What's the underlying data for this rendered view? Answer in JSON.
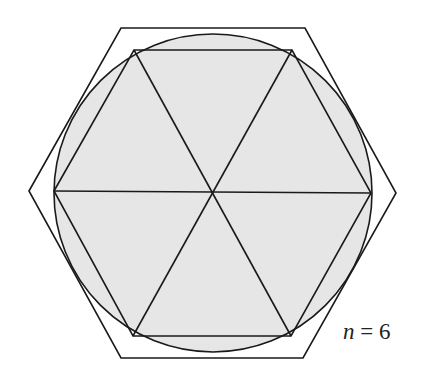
{
  "figure": {
    "label": {
      "variable": "n",
      "equals": " = ",
      "value": "6"
    },
    "colors": {
      "circle_fill": "#e6e6e6",
      "stroke": "#1a1a1a",
      "background": "#ffffff"
    },
    "geometry": {
      "center": [
        213,
        192
      ],
      "circle_radius": 159,
      "inscribed_hexagon": [
        [
          54,
          191
        ],
        [
          134,
          50
        ],
        [
          292,
          50
        ],
        [
          371,
          193
        ],
        [
          291,
          336
        ],
        [
          133,
          336
        ]
      ],
      "circumscribed_hexagon": [
        [
          29,
          191
        ],
        [
          121,
          28
        ],
        [
          305,
          28
        ],
        [
          396,
          193
        ],
        [
          303,
          358
        ],
        [
          121,
          358
        ]
      ]
    }
  }
}
